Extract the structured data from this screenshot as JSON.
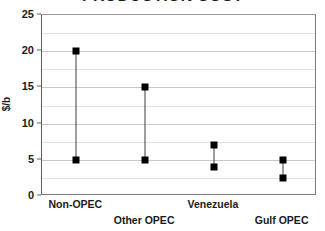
{
  "chart_data": {
    "type": "scatter",
    "title": "PRODUCTION COST",
    "xlabel": "",
    "ylabel": "$/b",
    "ylim": [
      0,
      25
    ],
    "ytick_values": [
      0,
      5,
      10,
      15,
      20,
      25
    ],
    "ytick_labels": [
      "0",
      "5",
      "10",
      "15",
      "20",
      "25"
    ],
    "gridlines": {
      "horizontal_major": [
        0,
        5,
        10,
        15,
        20,
        25
      ],
      "horizontal_minor": [
        2.5,
        7.5,
        12.5,
        17.5,
        22.5
      ],
      "vertical": false
    },
    "legend": "none",
    "marker": "filled-square",
    "categories": [
      "Non-OPEC",
      "Other OPEC",
      "Venezuela",
      "Gulf OPEC"
    ],
    "series": [
      {
        "name": "Low",
        "values": [
          5,
          5,
          4,
          2.5
        ]
      },
      {
        "name": "High",
        "values": [
          20,
          15,
          7,
          5
        ]
      }
    ],
    "points": [
      {
        "category": "Non-OPEC",
        "low": 5,
        "high": 20
      },
      {
        "category": "Other OPEC",
        "low": 5,
        "high": 15
      },
      {
        "category": "Venezuela",
        "low": 4,
        "high": 7
      },
      {
        "category": "Gulf OPEC",
        "low": 2.5,
        "high": 5
      }
    ],
    "colors": {
      "marker": "#000000",
      "line": "#3c3c3c",
      "gridline_major": "#c8c8c8",
      "gridline_minor": "#e2e2e2",
      "axis": "#5e5e5e",
      "text": "#1a1a1a",
      "background": "#ffffff"
    }
  },
  "axis": {
    "y_ticks": [
      {
        "label": "25",
        "value": 25
      },
      {
        "label": "20",
        "value": 20
      },
      {
        "label": "15",
        "value": 15
      },
      {
        "label": "10",
        "value": 10
      },
      {
        "label": "5",
        "value": 5
      },
      {
        "label": "0",
        "value": 0
      }
    ],
    "y_title": "$/b",
    "x_labels": [
      {
        "text": "Non-OPEC",
        "row": "top"
      },
      {
        "text": "Other OPEC",
        "row": "bottom"
      },
      {
        "text": "Venezuela",
        "row": "top"
      },
      {
        "text": "Gulf OPEC",
        "row": "bottom"
      }
    ]
  }
}
